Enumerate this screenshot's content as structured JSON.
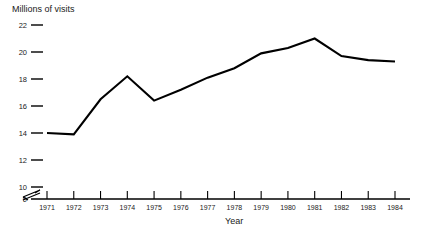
{
  "chart_data": {
    "type": "line",
    "title": "",
    "ylabel": "Millions of visits",
    "xlabel": "Year",
    "categories": [
      "1971",
      "1972",
      "1973",
      "1974",
      "1975",
      "1976",
      "1977",
      "1978",
      "1979",
      "1980",
      "1981",
      "1982",
      "1983",
      "1984"
    ],
    "x": [
      1971,
      1972,
      1973,
      1974,
      1975,
      1976,
      1977,
      1978,
      1979,
      1980,
      1981,
      1982,
      1983,
      1984
    ],
    "values": [
      14.0,
      13.9,
      16.5,
      18.2,
      16.4,
      17.2,
      18.1,
      18.8,
      19.9,
      20.3,
      21.0,
      19.7,
      19.4,
      19.3
    ],
    "series": [
      {
        "name": "Millions of visits",
        "values": [
          14.0,
          13.9,
          16.5,
          18.2,
          16.4,
          17.2,
          18.1,
          18.8,
          19.9,
          20.3,
          21.0,
          19.7,
          19.4,
          19.3
        ],
        "color": "#000000"
      }
    ],
    "y_ticks": [
      0,
      10,
      12,
      14,
      16,
      18,
      20,
      22
    ],
    "y_tick_labels": [
      "0",
      "10",
      "12",
      "14",
      "16",
      "18",
      "20",
      "22"
    ],
    "ylim": [
      0,
      22
    ],
    "xlim": [
      1971,
      1984
    ],
    "axis_break": true,
    "axis_break_between": [
      0,
      10
    ],
    "grid": false,
    "legend": false,
    "legend_position": "none",
    "line_color": "#000000",
    "axis_color": "#000000",
    "background_color": "#ffffff",
    "markers": false
  }
}
